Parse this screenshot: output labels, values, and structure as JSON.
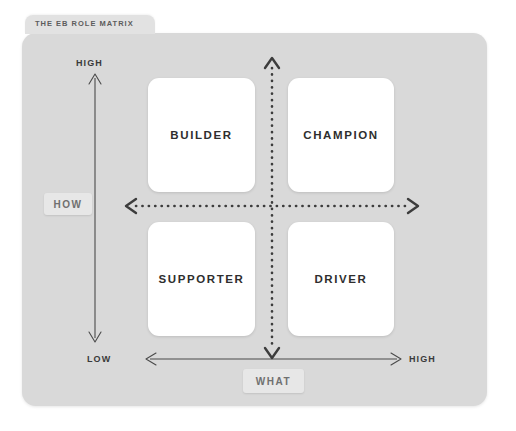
{
  "title": {
    "text": "THE EB ROLE MATRIX"
  },
  "matrix": {
    "quadrants": [
      {
        "key": "builder",
        "label": "BUILDER"
      },
      {
        "key": "champion",
        "label": "CHAMPION"
      },
      {
        "key": "supporter",
        "label": "SUPPORTER"
      },
      {
        "key": "driver",
        "label": "DRIVER"
      }
    ]
  },
  "axes": {
    "vertical": {
      "name": "HOW",
      "high_label": "HIGH",
      "low_label": "LOW"
    },
    "horizontal": {
      "name": "WHAT",
      "low_label": "LOW",
      "high_label": "HIGH"
    }
  },
  "colors": {
    "card_background": "#d9d9d9",
    "title_tab_background": "#e2e2e2",
    "quadrant_background": "#ffffff",
    "quadrant_text": "#2e2e2e",
    "axis_chip_background": "#e7e7e7",
    "axis_chip_text": "#707070",
    "axis_line": "#4a4a4a",
    "dotted_axis": "#3c3c3c",
    "page_background": "#ffffff"
  },
  "icons": {
    "vertical_solid_arrow": "double-arrow-vertical-icon",
    "horizontal_solid_arrow": "double-arrow-horizontal-icon",
    "vertical_dotted_arrow": "dotted-double-arrow-vertical-icon",
    "horizontal_dotted_arrow": "dotted-double-arrow-horizontal-icon"
  }
}
